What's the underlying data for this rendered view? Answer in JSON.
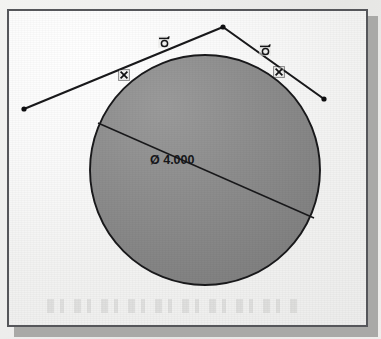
{
  "window": {
    "title": "CAD Sketch Viewport",
    "frame_color": "#55565a",
    "background_color": "#f3f3f1"
  },
  "sketch": {
    "name": "tangent-arc-sketch",
    "entity_color": "#1a1a1c",
    "fill_color": "#8c8c8c",
    "circle": {
      "name": "circle",
      "center_x": 203,
      "center_y": 168,
      "radius": 115
    },
    "lines": [
      {
        "name": "tangent-line-left",
        "x1": 22,
        "y1": 107,
        "x2": 221,
        "y2": 25
      },
      {
        "name": "tangent-line-right",
        "x1": 221,
        "y1": 25,
        "x2": 322,
        "y2": 97
      }
    ],
    "endpoints": [
      {
        "name": "endpoint-left",
        "x": 22,
        "y": 107
      },
      {
        "name": "endpoint-apex",
        "x": 221,
        "y": 25
      },
      {
        "name": "endpoint-right",
        "x": 322,
        "y": 97
      }
    ],
    "diameter_dimension": {
      "name": "diameter-dimension",
      "label": "Ø 4.000",
      "value": "4.000",
      "symbol": "Ø",
      "leader_x1": 96,
      "leader_y1": 121,
      "leader_x2": 312,
      "leader_y2": 216,
      "text_x": 148,
      "text_y": 159
    },
    "constraints": [
      {
        "name": "tangent-constraint-left",
        "type": "tangent",
        "glyph": "tangent",
        "x": 162,
        "y": 40
      },
      {
        "name": "tangent-constraint-right",
        "type": "tangent",
        "glyph": "tangent",
        "x": 263,
        "y": 48
      },
      {
        "name": "coincident-constraint-left",
        "type": "coincident",
        "glyph": "coincident",
        "x": 122,
        "y": 73
      },
      {
        "name": "coincident-constraint-right",
        "type": "coincident",
        "glyph": "coincident",
        "x": 277,
        "y": 70
      }
    ]
  }
}
